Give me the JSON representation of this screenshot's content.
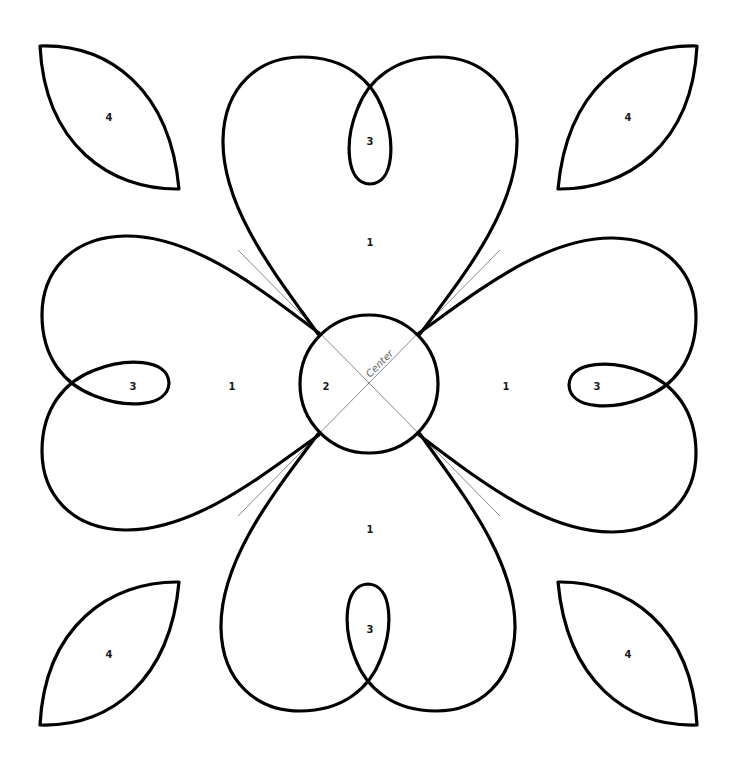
{
  "diagram": {
    "type": "applique-quilt-pattern",
    "center_label": "Center",
    "pieces": {
      "heart_petal": "1",
      "center_circle": "2",
      "heart_loop": "3",
      "corner_leaf": "4"
    },
    "labels": {
      "top_heart": "1",
      "bottom_heart": "1",
      "left_heart": "1",
      "right_heart": "1",
      "circle": "2",
      "top_loop": "3",
      "bottom_loop": "3",
      "left_loop": "3",
      "right_loop": "3",
      "leaf_top_left": "4",
      "leaf_top_right": "4",
      "leaf_bottom_left": "4",
      "leaf_bottom_right": "4"
    },
    "colors": {
      "outline": "#000000",
      "guide_lines": "#8a8a8a",
      "background": "#ffffff"
    }
  }
}
